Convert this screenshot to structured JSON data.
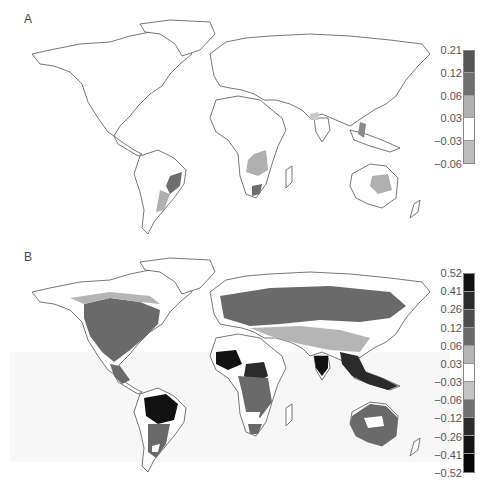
{
  "figure": {
    "panels": [
      {
        "label": "A",
        "colorbar": {
          "ticks": [
            "0.21",
            "0.12",
            "0.06",
            "0.03",
            "−0.03",
            "−0.06"
          ],
          "segments": [
            "#555555",
            "#6e6e6e",
            "#b0b0b0",
            "#ffffff",
            "#bdbdbd"
          ]
        }
      },
      {
        "label": "B",
        "colorbar": {
          "ticks": [
            "0.52",
            "0.41",
            "0.26",
            "0.12",
            "0.06",
            "0.03",
            "−0.03",
            "−0.06",
            "−0.12",
            "−0.26",
            "−0.41",
            "−0.52"
          ],
          "segments": [
            "#111111",
            "#2a2a2a",
            "#4d4d4d",
            "#6a6a6a",
            "#b5b5b5",
            "#ffffff",
            "#c4c4c4",
            "#6f6f6f",
            "#2b2b2b",
            "#141414",
            "#080808"
          ]
        }
      }
    ]
  },
  "chart_data": [
    {
      "type": "heatmap",
      "title": "A",
      "description": "World map, discrete grayscale shading of change values; mostly near zero, with positive values in southeastern South America, southern/eastern Africa, eastern Australia, parts of southern Asia",
      "colorbar_ticks": [
        0.21,
        0.12,
        0.06,
        0.03,
        -0.03,
        -0.06
      ],
      "legend_position": "right"
    },
    {
      "type": "heatmap",
      "title": "B",
      "description": "World map, discrete grayscale shading of change values; strong values in Amazon, central Africa, India, Southeast Asia; moderate across boreal North America and Eurasia, Australia",
      "colorbar_ticks": [
        0.52,
        0.41,
        0.26,
        0.12,
        0.06,
        0.03,
        -0.03,
        -0.06,
        -0.12,
        -0.26,
        -0.41,
        -0.52
      ],
      "legend_position": "right"
    }
  ]
}
